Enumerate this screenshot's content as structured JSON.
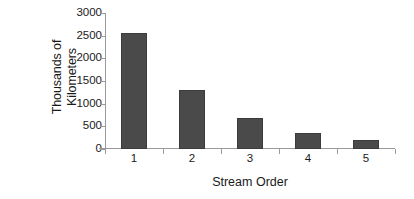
{
  "chart_data": {
    "type": "bar",
    "title": "",
    "subtitle": "",
    "xlabel": "Stream Order",
    "ylabel": "Thousands of Kilometers",
    "ylabel_line1": "Thousands of",
    "ylabel_line2": "Kilometers",
    "categories": [
      "1",
      "2",
      "3",
      "4",
      "5"
    ],
    "values": [
      2550,
      1300,
      680,
      360,
      200
    ],
    "series": [
      {
        "name": "Stream length",
        "values": [
          2550,
          1300,
          680,
          360,
          200
        ]
      }
    ],
    "ylim": [
      0,
      3000
    ],
    "yticks": [
      0,
      500,
      1000,
      1500,
      2000,
      2500,
      3000
    ],
    "ytick_labels": [
      "0",
      "500",
      "1000",
      "1500",
      "2000",
      "2500",
      "3000"
    ],
    "xtick_labels": [
      "1",
      "2",
      "3",
      "4",
      "5"
    ],
    "grid": false,
    "legend": false,
    "legend_position": "none",
    "annotations": [],
    "colors": {
      "bar_fill": "#4a4a4a",
      "bar_edge": "#3c3c3c",
      "axis": "#9a9a9a",
      "text": "#1a1a1a",
      "background": "#ffffff"
    }
  }
}
